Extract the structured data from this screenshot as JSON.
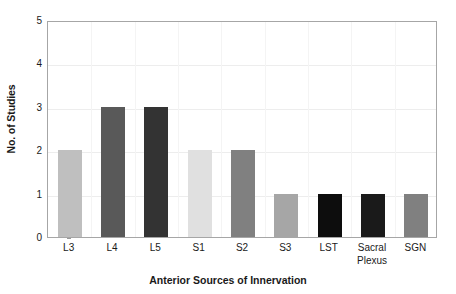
{
  "chart_data": {
    "type": "bar",
    "title": "",
    "xlabel": "Anterior Sources of Innervation",
    "ylabel": "No. of Studies",
    "categories": [
      "L3",
      "L4",
      "L5",
      "S1",
      "S2",
      "S3",
      "LST",
      "Sacral Plexus",
      "SGN"
    ],
    "values": [
      2,
      3,
      3,
      2,
      2,
      1,
      1,
      1,
      1
    ],
    "bar_colors": [
      "#bfbfbf",
      "#595959",
      "#333333",
      "#e0e0e0",
      "#808080",
      "#a6a6a6",
      "#0d0d0d",
      "#1a1a1a",
      "#808080"
    ],
    "ylim": [
      0,
      5
    ],
    "yticks": [
      0,
      1,
      2,
      3,
      4,
      5
    ],
    "ytick_labels": [
      "0",
      "1",
      "2",
      "3",
      "4",
      "5"
    ],
    "grid": true,
    "legend": false
  },
  "axes": {
    "y_title": "No. of Studies",
    "x_title": "Anterior Sources of Innervation"
  },
  "category_labels": [
    {
      "line1": "L3",
      "line2": ""
    },
    {
      "line1": "L4",
      "line2": ""
    },
    {
      "line1": "L5",
      "line2": ""
    },
    {
      "line1": "S1",
      "line2": ""
    },
    {
      "line1": "S2",
      "line2": ""
    },
    {
      "line1": "S3",
      "line2": ""
    },
    {
      "line1": "LST",
      "line2": ""
    },
    {
      "line1": "Sacral",
      "line2": "Plexus"
    },
    {
      "line1": "SGN",
      "line2": ""
    }
  ],
  "colors": {
    "plot_border": "#a6a6a6",
    "gridline": "#ededed",
    "text": "#1a1a1a",
    "background": "#ffffff"
  }
}
